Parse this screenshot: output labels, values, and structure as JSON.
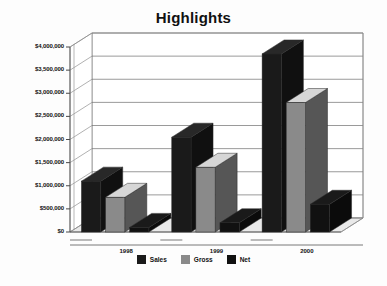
{
  "chart_data": {
    "type": "bar",
    "title": "Highlights",
    "xlabel": "",
    "ylabel": "",
    "categories": [
      "1998",
      "1999",
      "2000"
    ],
    "series": [
      {
        "name": "Sales",
        "color": "#1a1a1a",
        "values": [
          1100000,
          2050000,
          3850000
        ]
      },
      {
        "name": "Gross",
        "color": "#8a8a8a",
        "values": [
          750000,
          1400000,
          2800000
        ]
      },
      {
        "name": "Net",
        "color": "#111111",
        "values": [
          100000,
          200000,
          600000
        ]
      }
    ],
    "ylim": [
      0,
      4000000
    ],
    "ytick_values": [
      0,
      500000,
      1000000,
      1500000,
      2000000,
      2500000,
      3000000,
      3500000,
      4000000
    ],
    "ytick_labels": [
      "$0",
      "$500,000",
      "$1,000,000",
      "$1,500,000",
      "$2,000,000",
      "$2,500,000",
      "$3,000,000",
      "$3,500,000",
      "$4,000,000"
    ],
    "grid": true,
    "grid_axis": "y",
    "legend_position": "bottom",
    "three_d": true,
    "plot_background": "#ffffff"
  },
  "legend": {
    "items": [
      {
        "label": "Sales",
        "color": "#1a1a1a"
      },
      {
        "label": "Gross",
        "color": "#8a8a8a"
      },
      {
        "label": "Net",
        "color": "#111111"
      }
    ]
  }
}
